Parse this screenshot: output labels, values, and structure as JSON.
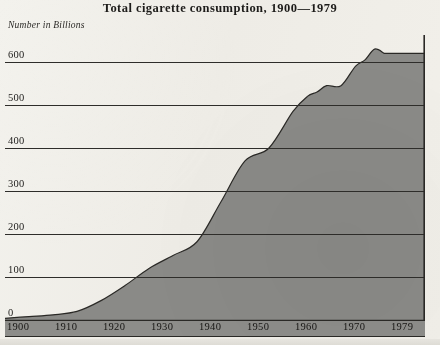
{
  "chart_data": {
    "type": "area",
    "title": "Total cigarette consumption, 1900—1979",
    "subtitle": "Number in Billions",
    "xlabel": "",
    "ylabel": "Number in Billions",
    "xlim": [
      1900,
      1979
    ],
    "ylim": [
      0,
      660
    ],
    "grid": true,
    "legend": "none",
    "fill_color": "#8a8a87",
    "line_color": "#2a2926",
    "grid_color": "#2e2d2a",
    "background_color": "#f1efe9",
    "y_ticks": [
      0,
      100,
      200,
      300,
      400,
      500,
      600
    ],
    "y_tick_labels": [
      "0",
      "100",
      "200",
      "300",
      "400",
      "500",
      "600"
    ],
    "x_ticks": [
      1900,
      1910,
      1920,
      1930,
      1940,
      1950,
      1960,
      1970,
      1979
    ],
    "x_tick_labels": [
      "1900",
      "1910",
      "1920",
      "1930",
      "1940",
      "1950",
      "1960",
      "1970",
      "1979"
    ],
    "x": [
      1900,
      1905,
      1910,
      1915,
      1920,
      1925,
      1930,
      1935,
      1940,
      1945,
      1950,
      1955,
      1960,
      1963,
      1965,
      1967,
      1970,
      1973,
      1975,
      1977,
      1979
    ],
    "values": [
      4,
      8,
      12,
      20,
      45,
      80,
      120,
      150,
      182,
      275,
      370,
      400,
      485,
      520,
      530,
      545,
      545,
      590,
      605,
      630,
      620
    ],
    "series": [
      {
        "name": "Total cigarette consumption",
        "values": [
          4,
          8,
          12,
          20,
          45,
          80,
          120,
          150,
          182,
          275,
          370,
          400,
          485,
          520,
          530,
          545,
          545,
          590,
          605,
          630,
          620
        ]
      }
    ]
  },
  "header": {
    "title": "Total cigarette consumption, 1900—1979",
    "subtitle": "Number in Billions"
  }
}
